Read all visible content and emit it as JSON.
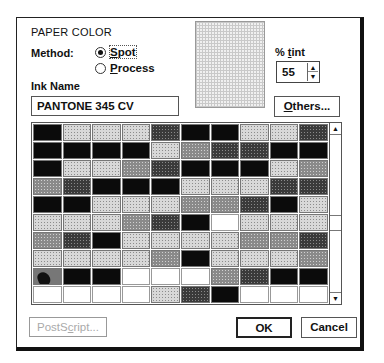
{
  "dialog": {
    "title": "PAPER COLOR",
    "method_label": "Method:",
    "method_options": [
      {
        "label_first": "S",
        "label_rest": "pot",
        "selected": true
      },
      {
        "label_first": "P",
        "label_rest": "rocess",
        "selected": false
      }
    ],
    "ink_name_label": "Ink Name",
    "ink_name_value": "PANTONE 345 CV",
    "tint_label_pre": "% ",
    "tint_label_u": "t",
    "tint_label_post": "int",
    "tint_value": "55",
    "spin_up_icon": "▲",
    "spin_down_icon": "▼",
    "others_button_u": "O",
    "others_button_rest": "thers...",
    "postscript_button_pre": "PostS",
    "postscript_button_u": "c",
    "postscript_button_post": "ript...",
    "ok_button": "OK",
    "cancel_button": "Cancel",
    "scroll_up_icon": "▲",
    "scroll_down_icon": "▼"
  },
  "swatch_grid": {
    "columns": 10,
    "rows": [
      [
        "k",
        "l",
        "l",
        "l",
        "d",
        "k",
        "k",
        "l",
        "l",
        "d"
      ],
      [
        "k",
        "k",
        "k",
        "k",
        "l",
        "m",
        "d",
        "d",
        "k",
        "k"
      ],
      [
        "k",
        "l",
        "l",
        "m",
        "d",
        "k",
        "k",
        "k",
        "l",
        "m"
      ],
      [
        "m",
        "d",
        "k",
        "k",
        "k",
        "l",
        "l",
        "l",
        "d",
        "d"
      ],
      [
        "k",
        "k",
        "l",
        "l",
        "l",
        "m",
        "m",
        "d",
        "k",
        "l"
      ],
      [
        "l",
        "l",
        "l",
        "m",
        "d",
        "k",
        "w",
        "l",
        "l",
        "l"
      ],
      [
        "m",
        "d",
        "k",
        "l",
        "l",
        "l",
        "l",
        "m",
        "m",
        "d"
      ],
      [
        "l",
        "l",
        "l",
        "l",
        "m",
        "k",
        "l",
        "l",
        "l",
        "m"
      ],
      [
        "img",
        "k",
        "k",
        "w",
        "w",
        "w",
        "m",
        "d",
        "k",
        "k"
      ],
      [
        "w",
        "w",
        "w",
        "w",
        "l",
        "d",
        "k",
        "w",
        "w",
        "w"
      ]
    ]
  }
}
